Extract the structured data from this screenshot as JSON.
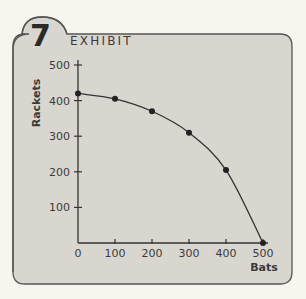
{
  "exhibit": {
    "number": "7",
    "label": "EXHIBIT"
  },
  "colors": {
    "page_background": "#f7f5ee",
    "card_background": "#d9d6d0",
    "card_border": "#555555",
    "line": "#333333",
    "point": "#222222"
  },
  "chart_data": {
    "type": "line",
    "xlabel": "Bats",
    "ylabel": "Rackets",
    "x": [
      0,
      100,
      200,
      300,
      400,
      500
    ],
    "series": [
      {
        "name": "Production possibilities frontier",
        "values": [
          420,
          405,
          370,
          310,
          205,
          0
        ]
      }
    ],
    "xlim": [
      0,
      500
    ],
    "ylim": [
      0,
      500
    ],
    "xticks": [
      "0",
      "100",
      "200",
      "300",
      "400",
      "500"
    ],
    "yticks": [
      "100",
      "200",
      "300",
      "400",
      "500"
    ],
    "grid": false,
    "legend": "none"
  }
}
